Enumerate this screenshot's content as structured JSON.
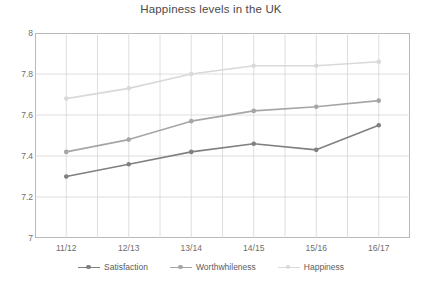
{
  "chart_data": {
    "type": "line",
    "title": "Happiness levels in the UK",
    "xlabel": "",
    "ylabel": "",
    "categories": [
      "11/12",
      "12/13",
      "13/14",
      "14/15",
      "15/16",
      "16/17"
    ],
    "ylim": [
      7,
      8
    ],
    "yticks": [
      7,
      7.2,
      7.4,
      7.6,
      7.8,
      8
    ],
    "ytick_labels": [
      "7",
      "7.2",
      "7.4",
      "7.6",
      "7.8",
      "8"
    ],
    "grid": true,
    "legend_position": "bottom",
    "series": [
      {
        "name": "Satisfaction",
        "color": "#808080",
        "values": [
          7.3,
          7.36,
          7.42,
          7.46,
          7.43,
          7.55
        ]
      },
      {
        "name": "Worthwhileness",
        "color": "#a6a6a6",
        "values": [
          7.42,
          7.48,
          7.57,
          7.62,
          7.64,
          7.67
        ]
      },
      {
        "name": "Happiness",
        "color": "#d9d9d9",
        "values": [
          7.68,
          7.73,
          7.8,
          7.84,
          7.84,
          7.86
        ]
      }
    ]
  },
  "axis": {
    "tick_labels_y": [
      "8",
      "7.8",
      "7.6",
      "7.4",
      "7.2",
      "7"
    ],
    "tick_labels_x": [
      "11/12",
      "12/13",
      "13/14",
      "14/15",
      "15/16",
      "16/17"
    ]
  },
  "legend": {
    "items": [
      {
        "label": "Satisfaction",
        "color": "#808080"
      },
      {
        "label": "Worthwhileness",
        "color": "#a6a6a6"
      },
      {
        "label": "Happiness",
        "color": "#d9d9d9"
      }
    ]
  },
  "colors": {
    "grid": "#d6d6d6",
    "axis_border": "#b9b9b9",
    "title_text": "#4a4a4a",
    "tick_text": "#6e6e6e",
    "plot_background": "#ffffff"
  }
}
